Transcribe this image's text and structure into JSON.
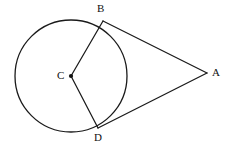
{
  "figure": {
    "background_color": "#ffffff",
    "stroke_color": "#1a1a1a",
    "width": 228,
    "height": 150
  },
  "circle": {
    "name": "circle-C",
    "center_x": 71,
    "center_y": 76,
    "radius": 56,
    "stroke_color": "#1a1a1a",
    "stroke_width": 1.3,
    "fill": "none"
  },
  "points": {
    "B": {
      "label": "B",
      "x": 103,
      "y": 21,
      "label_x": 97,
      "label_y": 3,
      "role": "tangent-point-upper"
    },
    "A": {
      "label": "A",
      "x": 207,
      "y": 73,
      "label_x": 212,
      "label_y": 67,
      "role": "external-vertex"
    },
    "C": {
      "label": "C",
      "x": 71,
      "y": 76,
      "label_x": 57,
      "label_y": 70,
      "role": "circle-center",
      "dot_radius": 2.1
    },
    "D": {
      "label": "D",
      "x": 98,
      "y": 128,
      "label_x": 94,
      "label_y": 132,
      "role": "tangent-point-lower"
    }
  },
  "segments": [
    {
      "name": "segment-CB",
      "from": "C",
      "to": "B",
      "x1": 71,
      "y1": 76,
      "x2": 103,
      "y2": 21
    },
    {
      "name": "segment-CD",
      "from": "C",
      "to": "D",
      "x1": 71,
      "y1": 76,
      "x2": 98,
      "y2": 128
    },
    {
      "name": "segment-BA",
      "from": "B",
      "to": "A",
      "x1": 103,
      "y1": 21,
      "x2": 207,
      "y2": 73
    },
    {
      "name": "segment-DA",
      "from": "D",
      "to": "A",
      "x1": 98,
      "y1": 128,
      "x2": 207,
      "y2": 73
    }
  ]
}
